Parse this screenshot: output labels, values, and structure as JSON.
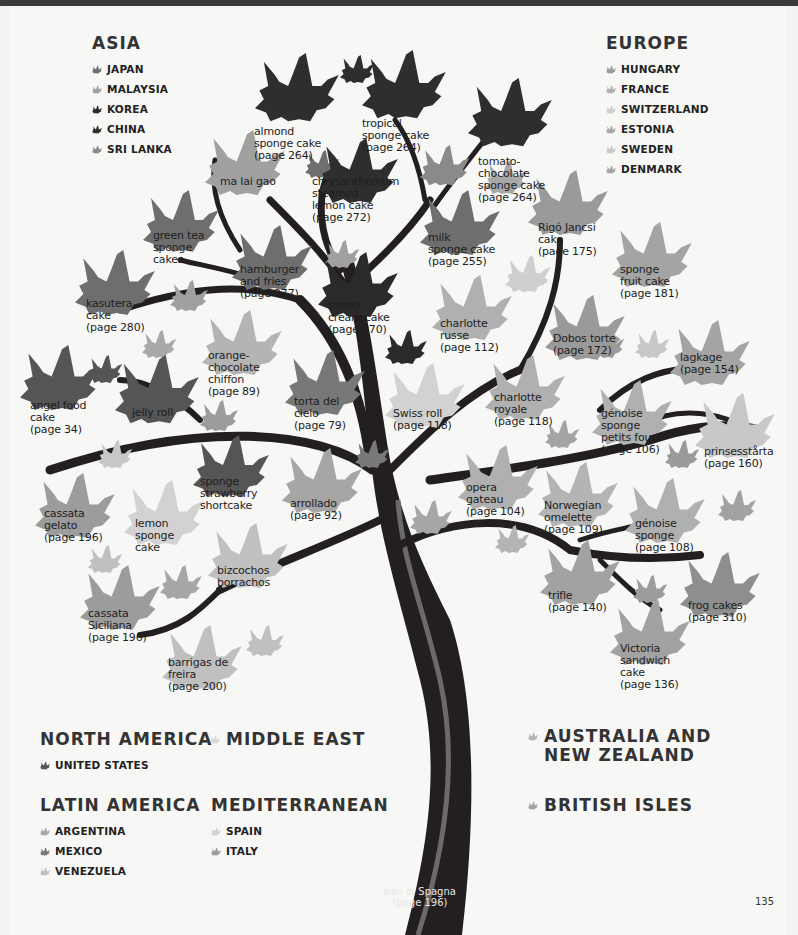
{
  "page_number": "135",
  "colors": {
    "japan": "#6e6e6e",
    "malaysia": "#a0a0a0",
    "korea": "#2a2a2a",
    "china": "#2e2e2e",
    "sri_lanka": "#8a8a8a",
    "hungary": "#9a9a9a",
    "france": "#b0b0b0",
    "switzerland": "#cfcfcf",
    "estonia": "#a8a8a8",
    "sweden": "#c8c8c8",
    "denmark": "#a4a4a4",
    "united_states": "#555555",
    "argentina": "#a6a6a6",
    "mexico": "#787878",
    "venezuela": "#c0c0c0",
    "spain": "#d2d2d2",
    "italy": "#9c9c9c",
    "middle_east": "#d8d8d8",
    "australia_nz": "#b4b4b4",
    "british_isles": "#a2a2a2",
    "trunk": "#231f20",
    "trunk_stripe": "#6a6a6a"
  },
  "legend": {
    "asia": {
      "title": "ASIA",
      "items": [
        {
          "label": "JAPAN",
          "color": "#6e6e6e"
        },
        {
          "label": "MALAYSIA",
          "color": "#a0a0a0"
        },
        {
          "label": "KOREA",
          "color": "#2a2a2a"
        },
        {
          "label": "CHINA",
          "color": "#2e2e2e"
        },
        {
          "label": "SRI LANKA",
          "color": "#8a8a8a"
        }
      ]
    },
    "europe": {
      "title": "EUROPE",
      "items": [
        {
          "label": "HUNGARY",
          "color": "#9a9a9a"
        },
        {
          "label": "FRANCE",
          "color": "#b0b0b0"
        },
        {
          "label": "SWITZERLAND",
          "color": "#cfcfcf"
        },
        {
          "label": "ESTONIA",
          "color": "#a8a8a8"
        },
        {
          "label": "SWEDEN",
          "color": "#c8c8c8"
        },
        {
          "label": "DENMARK",
          "color": "#a4a4a4"
        }
      ]
    },
    "north_america": {
      "title": "NORTH AMERICA",
      "items": [
        {
          "label": "UNITED STATES",
          "color": "#555555"
        }
      ]
    },
    "middle_east": {
      "title": "MIDDLE EAST",
      "color": "#d8d8d8"
    },
    "latin_america": {
      "title": "LATIN AMERICA",
      "items": [
        {
          "label": "ARGENTINA",
          "color": "#a6a6a6"
        },
        {
          "label": "MEXICO",
          "color": "#787878"
        },
        {
          "label": "VENEZUELA",
          "color": "#c0c0c0"
        }
      ]
    },
    "mediterranean": {
      "title": "MEDITERRANEAN",
      "items": [
        {
          "label": "SPAIN",
          "color": "#d2d2d2"
        },
        {
          "label": "ITALY",
          "color": "#9c9c9c"
        }
      ]
    },
    "australia_nz": {
      "title": "AUSTRALIA AND\nNEW ZEALAND",
      "color": "#b4b4b4"
    },
    "british_isles": {
      "title": "BRITISH ISLES",
      "color": "#a2a2a2"
    }
  },
  "trunk": {
    "label": "pan di Spagna\n(page 196)"
  },
  "leaves": [
    {
      "id": "almond",
      "label": "almond\nsponge cake\n(page 264)",
      "x": 255,
      "y": 53,
      "s": 1.05,
      "color": "#2e2e2e",
      "tx": 254,
      "ty": 126,
      "light": false
    },
    {
      "id": "tropical",
      "label": "tropical\nsponge cake\n(page 264)",
      "x": 362,
      "y": 50,
      "s": 1.05,
      "color": "#2e2e2e",
      "tx": 362,
      "ty": 118
    },
    {
      "id": "tomato",
      "label": "tomato-\nchocolate\nsponge cake\n(page 264)",
      "x": 468,
      "y": 78,
      "s": 1.05,
      "color": "#2e2e2e",
      "tx": 478,
      "ty": 156
    },
    {
      "id": "malaigao",
      "label": "ma lai gao",
      "x": 205,
      "y": 130,
      "s": 1.0,
      "color": "#a0a0a0",
      "tx": 220,
      "ty": 176
    },
    {
      "id": "chrysanthemum",
      "label": "chrysanthemum\nsteamed\nlemon cake\n(page 272)",
      "x": 318,
      "y": 138,
      "s": 1.0,
      "color": "#2e2e2e",
      "tx": 312,
      "ty": 176
    },
    {
      "id": "greentea",
      "label": "green tea\nsponge\ncakes",
      "x": 143,
      "y": 190,
      "s": 0.95,
      "color": "#6e6e6e",
      "tx": 153,
      "ty": 230
    },
    {
      "id": "milk",
      "label": "milk\nsponge cake\n(page 255)",
      "x": 420,
      "y": 190,
      "s": 1.0,
      "color": "#6e6e6e",
      "tx": 428,
      "ty": 232
    },
    {
      "id": "rigo",
      "label": "Rigó Jancsi\ncake\n(page 175)",
      "x": 528,
      "y": 170,
      "s": 1.0,
      "color": "#9a9a9a",
      "tx": 538,
      "ty": 222
    },
    {
      "id": "hamburger",
      "label": "hamburger\nand fries\n(page 277)",
      "x": 232,
      "y": 225,
      "s": 1.0,
      "color": "#6e6e6e",
      "tx": 240,
      "ty": 264
    },
    {
      "id": "sponge_fruit",
      "label": "sponge\nfruit cake\n(page 181)",
      "x": 612,
      "y": 222,
      "s": 1.0,
      "color": "#a4a4a4",
      "tx": 620,
      "ty": 264
    },
    {
      "id": "kasutera",
      "label": "kasutera\ncake\n(page 280)",
      "x": 75,
      "y": 250,
      "s": 1.0,
      "color": "#6e6e6e",
      "tx": 86,
      "ty": 298
    },
    {
      "id": "saeng",
      "label": "saeng\ncream cake\n(page 270)",
      "x": 318,
      "y": 252,
      "s": 1.0,
      "color": "#2a2a2a",
      "tx": 328,
      "ty": 300
    },
    {
      "id": "charlotte_russe",
      "label": "charlotte\nrusse\n(page 112)",
      "x": 432,
      "y": 275,
      "s": 1.0,
      "color": "#b0b0b0",
      "tx": 440,
      "ty": 318
    },
    {
      "id": "dobos",
      "label": "Dobos torte\n(page 172)",
      "x": 545,
      "y": 295,
      "s": 1.0,
      "color": "#9a9a9a",
      "tx": 553,
      "ty": 333
    },
    {
      "id": "lagkage",
      "label": "lagkage\n(page 154)",
      "x": 670,
      "y": 320,
      "s": 1.0,
      "color": "#a4a4a4",
      "tx": 680,
      "ty": 352
    },
    {
      "id": "orange_choc",
      "label": "orange-\nchocolate\nchiffon\n(page 89)",
      "x": 202,
      "y": 310,
      "s": 1.0,
      "color": "#b4b4b4",
      "tx": 208,
      "ty": 350
    },
    {
      "id": "torta",
      "label": "torta del\ncielo\n(page 79)",
      "x": 285,
      "y": 350,
      "s": 1.0,
      "color": "#787878",
      "tx": 294,
      "ty": 396
    },
    {
      "id": "swiss",
      "label": "Swiss roll\n(page 118)",
      "x": 385,
      "y": 363,
      "s": 1.0,
      "color": "#d2d2d2",
      "tx": 393,
      "ty": 408
    },
    {
      "id": "charlotte_royale",
      "label": "charlotte\nroyale\n(page 118)",
      "x": 485,
      "y": 355,
      "s": 1.0,
      "color": "#b0b0b0",
      "tx": 494,
      "ty": 392
    },
    {
      "id": "angel",
      "label": "angel food\ncake\n(page 34)",
      "x": 20,
      "y": 345,
      "s": 1.0,
      "color": "#555555",
      "tx": 30,
      "ty": 400
    },
    {
      "id": "jelly",
      "label": "jelly roll",
      "x": 115,
      "y": 355,
      "s": 1.05,
      "color": "#555555",
      "tx": 132,
      "ty": 407
    },
    {
      "id": "genoise_pf",
      "label": "génoise\nsponge\npetits fours\n(page 106)",
      "x": 592,
      "y": 380,
      "s": 1.0,
      "color": "#b0b0b0",
      "tx": 601,
      "ty": 408
    },
    {
      "id": "prinsess",
      "label": "prinsesstårta\n(page 160)",
      "x": 695,
      "y": 393,
      "s": 1.0,
      "color": "#c8c8c8",
      "tx": 704,
      "ty": 446
    },
    {
      "id": "strawberry",
      "label": "sponge\nstrawberry\nshortcake",
      "x": 193,
      "y": 435,
      "s": 0.95,
      "color": "#555555",
      "tx": 200,
      "ty": 476
    },
    {
      "id": "arrollado",
      "label": "arrollado\n(page 92)",
      "x": 282,
      "y": 448,
      "s": 1.0,
      "color": "#a6a6a6",
      "tx": 290,
      "ty": 498
    },
    {
      "id": "opera",
      "label": "opera\ngateau\n(page 104)",
      "x": 458,
      "y": 445,
      "s": 1.0,
      "color": "#b0b0b0",
      "tx": 466,
      "ty": 482
    },
    {
      "id": "norwegian",
      "label": "Norwegian\nomelette\n(page 109)",
      "x": 538,
      "y": 462,
      "s": 1.0,
      "color": "#b4b4b4",
      "tx": 544,
      "ty": 500
    },
    {
      "id": "genoise",
      "label": "génoise\nsponge\n(page 108)",
      "x": 625,
      "y": 478,
      "s": 1.0,
      "color": "#b0b0b0",
      "tx": 635,
      "ty": 518
    },
    {
      "id": "cassata_gelato",
      "label": "cassata\ngelato\n(page 196)",
      "x": 35,
      "y": 473,
      "s": 1.0,
      "color": "#9c9c9c",
      "tx": 44,
      "ty": 508
    },
    {
      "id": "lemon",
      "label": "lemon\nsponge\ncake",
      "x": 124,
      "y": 480,
      "s": 1.0,
      "color": "#d2d2d2",
      "tx": 135,
      "ty": 518
    },
    {
      "id": "bizcochos",
      "label": "bizcochos\nborrachos",
      "x": 208,
      "y": 523,
      "s": 1.0,
      "color": "#c0c0c0",
      "tx": 217,
      "ty": 565
    },
    {
      "id": "trifle",
      "label": "trifle\n(page 140)",
      "x": 540,
      "y": 540,
      "s": 1.0,
      "color": "#a2a2a2",
      "tx": 548,
      "ty": 590
    },
    {
      "id": "frog",
      "label": "frog cakes\n(page 310)",
      "x": 680,
      "y": 552,
      "s": 1.0,
      "color": "#8e8e8e",
      "tx": 688,
      "ty": 600
    },
    {
      "id": "cassata_sic",
      "label": "cassata\nSiciliana\n(page 196)",
      "x": 80,
      "y": 565,
      "s": 1.0,
      "color": "#9c9c9c",
      "tx": 88,
      "ty": 608
    },
    {
      "id": "victoria",
      "label": "Victoria\nsandwich\ncake\n(page 136)",
      "x": 610,
      "y": 600,
      "s": 1.0,
      "color": "#a2a2a2",
      "tx": 620,
      "ty": 643
    },
    {
      "id": "barrigas",
      "label": "barrigas de\nfreira\n(page 200)",
      "x": 162,
      "y": 625,
      "s": 1.0,
      "color": "#c0c0c0",
      "tx": 168,
      "ty": 657
    }
  ]
}
